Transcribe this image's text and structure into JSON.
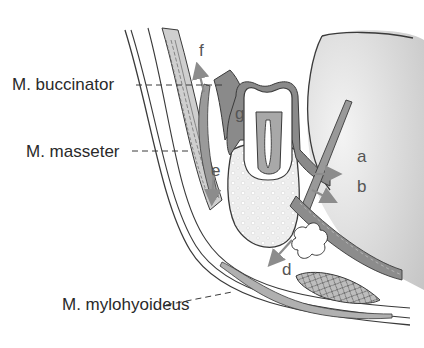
{
  "diagram": {
    "labels": [
      {
        "id": "buccinator",
        "text": "M. buccinator"
      },
      {
        "id": "masseter",
        "text": "M. masseter"
      },
      {
        "id": "mylohyoideus",
        "text": "M. mylohyoideus"
      }
    ],
    "letters": {
      "a": "a",
      "b": "b",
      "d": "d",
      "e": "e",
      "f": "f",
      "g": "g"
    },
    "colors": {
      "outline": "#3a3a3a",
      "tissue_dark": "#7a7a7a",
      "tissue_mid": "#a8a8a8",
      "tissue_light": "#e4e4e4",
      "bone": "#eeeeee",
      "arrow": "#8c8c8c",
      "background": "#ffffff"
    }
  }
}
